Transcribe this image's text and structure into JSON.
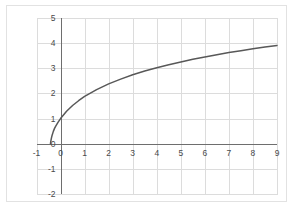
{
  "chart_data": {
    "type": "line",
    "title": "",
    "subtitle": "",
    "xlabel": "",
    "ylabel": "",
    "xlim": [
      -1,
      9
    ],
    "ylim": [
      -2,
      5
    ],
    "grid": true,
    "legend": null,
    "legend_position": "none",
    "x_ticks": [
      "-1",
      "0",
      "1",
      "2",
      "3",
      "4",
      "5",
      "6",
      "7",
      "8",
      "9"
    ],
    "y_ticks": [
      "5",
      "4",
      "3",
      "2",
      "1",
      "0",
      "-1",
      "-2"
    ],
    "x_tick_values": [
      -1,
      0,
      1,
      2,
      3,
      4,
      5,
      6,
      7,
      8,
      9
    ],
    "y_tick_values": [
      5,
      4,
      3,
      2,
      1,
      0,
      -1,
      -2
    ],
    "annotations": [],
    "series": [
      {
        "name": "curve",
        "color": "#585858",
        "line_width": 1.5,
        "x": [
          -0.42,
          -0.4,
          -0.38,
          -0.35,
          -0.3,
          -0.25,
          -0.2,
          -0.1,
          0.0,
          0.25,
          0.5,
          0.75,
          1.0,
          1.5,
          2.0,
          2.5,
          3.0,
          3.5,
          4.0,
          4.5,
          5.0,
          5.5,
          6.0,
          6.5,
          7.0,
          7.5,
          8.0,
          8.5,
          9.0
        ],
        "y": [
          0.0,
          0.12,
          0.22,
          0.34,
          0.49,
          0.61,
          0.7,
          0.86,
          1.0,
          1.29,
          1.52,
          1.71,
          1.88,
          2.15,
          2.38,
          2.57,
          2.74,
          2.89,
          3.02,
          3.14,
          3.25,
          3.36,
          3.45,
          3.54,
          3.63,
          3.7,
          3.78,
          3.85,
          3.91
        ]
      }
    ],
    "axis_color": "#6e6e6e",
    "grid_color": "#dcdcdc",
    "background_color": "#ffffff",
    "frame_color": "#e2e2e2"
  }
}
